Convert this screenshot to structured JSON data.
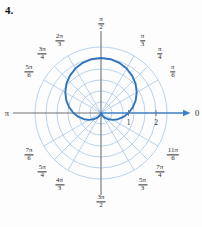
{
  "figure": {
    "number_label": "4.",
    "background_color": "#fdfdfd"
  },
  "colors": {
    "grid": "#a8c7e8",
    "grid_light": "#bed6ee",
    "curve": "#2f74bd",
    "axis": "#6f7276",
    "polar_axis": "#3c7fc4",
    "text": "#2b2b2b"
  },
  "axes": {
    "zero_label": "0",
    "pi_label": "π",
    "radial_ticks": [
      {
        "label": "1",
        "value": 1
      },
      {
        "label": "2",
        "value": 2
      }
    ]
  },
  "angle_labels": [
    {
      "name": "pi-over-6",
      "num": "π",
      "den": "6",
      "angle_deg": 30,
      "kind": "frac"
    },
    {
      "name": "pi-over-4",
      "num": "π",
      "den": "4",
      "angle_deg": 45,
      "kind": "frac"
    },
    {
      "name": "pi-over-3",
      "num": "π",
      "den": "3",
      "angle_deg": 60,
      "kind": "frac"
    },
    {
      "name": "pi-over-2",
      "num": "π",
      "den": "2",
      "angle_deg": 90,
      "kind": "frac"
    },
    {
      "name": "two-pi-over-3",
      "num": "2π",
      "den": "3",
      "angle_deg": 120,
      "kind": "frac"
    },
    {
      "name": "three-pi-over-4",
      "num": "3π",
      "den": "4",
      "angle_deg": 135,
      "kind": "frac"
    },
    {
      "name": "five-pi-over-6",
      "num": "5π",
      "den": "6",
      "angle_deg": 150,
      "kind": "frac"
    },
    {
      "name": "pi",
      "num": "π",
      "den": "",
      "angle_deg": 180,
      "kind": "plain"
    },
    {
      "name": "seven-pi-over-6",
      "num": "7π",
      "den": "6",
      "angle_deg": 210,
      "kind": "frac"
    },
    {
      "name": "five-pi-over-4",
      "num": "5π",
      "den": "4",
      "angle_deg": 225,
      "kind": "frac"
    },
    {
      "name": "four-pi-over-3",
      "num": "4π",
      "den": "3",
      "angle_deg": 240,
      "kind": "frac"
    },
    {
      "name": "three-pi-over-2",
      "num": "3π",
      "den": "2",
      "angle_deg": 270,
      "kind": "frac"
    },
    {
      "name": "five-pi-over-3",
      "num": "5π",
      "den": "3",
      "angle_deg": 300,
      "kind": "frac"
    },
    {
      "name": "seven-pi-over-4",
      "num": "7π",
      "den": "4",
      "angle_deg": 315,
      "kind": "frac"
    },
    {
      "name": "eleven-pi-over-6",
      "num": "11π",
      "den": "6",
      "angle_deg": 330,
      "kind": "frac"
    },
    {
      "name": "zero",
      "num": "0",
      "den": "",
      "angle_deg": 0,
      "kind": "plain"
    }
  ],
  "chart_data": {
    "type": "line",
    "plot_kind": "polar",
    "title": "",
    "equation": "r = 1 + sinθ",
    "rlim": [
      0,
      2.6
    ],
    "grid": true,
    "grid_circles": [
      0.4,
      0.8,
      1.2,
      1.6,
      2.0,
      2.4
    ],
    "radial_tick_values": [
      1,
      2
    ],
    "angle_spokes_deg": [
      0,
      30,
      45,
      60,
      90,
      120,
      135,
      150,
      180,
      210,
      225,
      240,
      270,
      300,
      315,
      330
    ],
    "series": [
      {
        "name": "cardioid",
        "theta_deg": [
          0,
          10,
          20,
          30,
          40,
          50,
          60,
          70,
          80,
          90,
          100,
          110,
          120,
          130,
          140,
          150,
          160,
          170,
          180,
          190,
          200,
          210,
          220,
          230,
          240,
          250,
          260,
          270,
          280,
          290,
          300,
          310,
          320,
          330,
          340,
          350,
          360
        ],
        "r": [
          1.0,
          1.174,
          1.342,
          1.5,
          1.643,
          1.766,
          1.866,
          1.94,
          1.985,
          2.0,
          1.985,
          1.94,
          1.866,
          1.766,
          1.643,
          1.5,
          1.342,
          1.174,
          1.0,
          0.826,
          0.658,
          0.5,
          0.357,
          0.234,
          0.134,
          0.06,
          0.015,
          0.0,
          0.015,
          0.06,
          0.134,
          0.234,
          0.357,
          0.5,
          0.658,
          0.826,
          1.0
        ]
      }
    ]
  }
}
